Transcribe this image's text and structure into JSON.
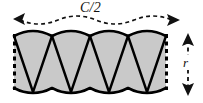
{
  "figure": {
    "type": "technical-diagram",
    "labels": {
      "width_label": "C/2",
      "height_label": "r"
    },
    "annotations": [
      {
        "name": "width-dimension",
        "text": "C/2",
        "orientation": "horizontal",
        "style": "dashed curved double-headed arrow",
        "position": "above band"
      },
      {
        "name": "height-dimension",
        "text": "r",
        "orientation": "vertical",
        "style": "dashed straight double-headed arrow",
        "position": "right of band"
      }
    ],
    "geometry": {
      "band_left": 14,
      "band_right": 166,
      "band_top": 33,
      "band_bottom": 91,
      "scallop_count": 4,
      "scallop_period": 38,
      "arc_bulge": 7,
      "zigzag_vertex_count": 9
    },
    "colors": {
      "fill": "#c9c9c9",
      "stroke": "#000000",
      "dashed_edge": "#000000",
      "background": "#ffffff",
      "label": "#111111"
    }
  }
}
